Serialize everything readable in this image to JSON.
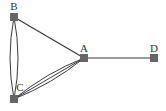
{
  "diagram": {
    "type": "multigraph",
    "colors": {
      "edge": "#3a3a3a",
      "node": "#666666",
      "label": "#333333",
      "background": "#ffffff"
    },
    "nodes": [
      {
        "id": "A",
        "label": "A",
        "x": 84,
        "y": 58,
        "label_x": 84,
        "label_y": 48
      },
      {
        "id": "B",
        "label": "B",
        "x": 14,
        "y": 17,
        "label_x": 14,
        "label_y": 6
      },
      {
        "id": "C",
        "label": "C",
        "x": 14,
        "y": 99,
        "label_x": 20,
        "label_y": 87
      },
      {
        "id": "D",
        "label": "D",
        "x": 154,
        "y": 58,
        "label_x": 154,
        "label_y": 48
      }
    ],
    "edges": [
      {
        "from": "B",
        "to": "A",
        "count": 1
      },
      {
        "from": "A",
        "to": "D",
        "count": 1
      },
      {
        "from": "B",
        "to": "C",
        "count": 2
      },
      {
        "from": "A",
        "to": "C",
        "count": 3
      }
    ]
  }
}
